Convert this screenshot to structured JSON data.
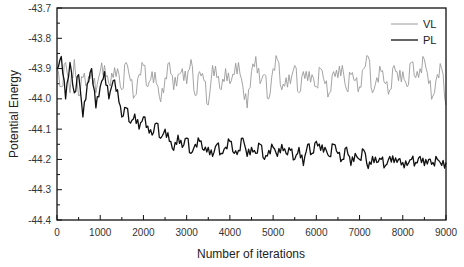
{
  "chart_data": {
    "type": "line",
    "title": "",
    "xlabel": "Number of iterations",
    "ylabel": "Potential Energy",
    "xlim": [
      0,
      9000
    ],
    "ylim": [
      -44.4,
      -43.7
    ],
    "x_ticks": [
      0,
      1000,
      2000,
      3000,
      4000,
      5000,
      6000,
      7000,
      8000,
      9000
    ],
    "x_tick_labels": [
      "0",
      "1000",
      "2000",
      "3000",
      "4000",
      "5000",
      "6000",
      "7000",
      "8000",
      "9000"
    ],
    "y_ticks": [
      -43.7,
      -43.8,
      -43.9,
      -44.0,
      -44.1,
      -44.2,
      -44.3,
      -44.4
    ],
    "y_tick_labels": [
      "-43.7",
      "-43.8",
      "-43.9",
      "-44.0",
      "-44.1",
      "-44.2",
      "-44.3",
      "-44.4"
    ],
    "grid": false,
    "legend_position": "upper right",
    "x": [
      0,
      100,
      200,
      300,
      400,
      500,
      600,
      700,
      800,
      900,
      1000,
      1100,
      1200,
      1300,
      1400,
      1500,
      1600,
      1700,
      1800,
      1900,
      2000,
      2100,
      2200,
      2300,
      2400,
      2500,
      2600,
      2700,
      2800,
      2900,
      3000,
      3100,
      3200,
      3300,
      3400,
      3500,
      3600,
      3700,
      3800,
      3900,
      4000,
      4100,
      4200,
      4300,
      4400,
      4500,
      4600,
      4700,
      4800,
      4900,
      5000,
      5100,
      5200,
      5300,
      5400,
      5500,
      5600,
      5700,
      5800,
      5900,
      6000,
      6100,
      6200,
      6300,
      6400,
      6500,
      6600,
      6700,
      6800,
      6900,
      7000,
      7100,
      7200,
      7300,
      7400,
      7500,
      7600,
      7700,
      7800,
      7900,
      8000,
      8100,
      8200,
      8300,
      8400,
      8500,
      8600,
      8700,
      8800,
      8900,
      9000
    ],
    "series": [
      {
        "name": "VL",
        "color": "#9a9a9a",
        "values": [
          -43.9,
          -43.96,
          -43.88,
          -43.98,
          -43.87,
          -43.99,
          -43.93,
          -43.95,
          -43.9,
          -43.98,
          -43.91,
          -43.89,
          -43.95,
          -43.93,
          -43.9,
          -43.97,
          -43.88,
          -43.94,
          -43.99,
          -43.92,
          -43.89,
          -43.96,
          -43.91,
          -43.95,
          -44.01,
          -43.93,
          -43.88,
          -43.97,
          -43.92,
          -43.9,
          -43.95,
          -43.87,
          -43.99,
          -43.91,
          -43.94,
          -44.02,
          -43.89,
          -43.93,
          -43.97,
          -43.9,
          -43.95,
          -43.92,
          -43.88,
          -43.96,
          -44.03,
          -43.91,
          -43.86,
          -43.95,
          -43.92,
          -44.0,
          -43.9,
          -43.87,
          -43.97,
          -43.93,
          -43.95,
          -43.89,
          -43.98,
          -43.91,
          -43.94,
          -43.92,
          -43.96,
          -43.9,
          -43.95,
          -43.98,
          -43.91,
          -43.93,
          -43.89,
          -43.97,
          -43.92,
          -43.94,
          -43.96,
          -43.9,
          -43.86,
          -43.98,
          -43.93,
          -43.91,
          -43.95,
          -43.97,
          -43.89,
          -43.94,
          -43.91,
          -43.96,
          -43.88,
          -43.93,
          -43.9,
          -43.87,
          -43.95,
          -43.99,
          -43.92,
          -43.9,
          -44.02
        ]
      },
      {
        "name": "PL",
        "color": "#111111",
        "values": [
          -43.9,
          -43.86,
          -44.0,
          -43.88,
          -43.98,
          -43.92,
          -44.06,
          -43.95,
          -43.9,
          -44.03,
          -43.96,
          -43.91,
          -44.0,
          -43.94,
          -43.97,
          -44.06,
          -44.03,
          -44.08,
          -44.05,
          -44.1,
          -44.06,
          -44.09,
          -44.12,
          -44.08,
          -44.13,
          -44.1,
          -44.14,
          -44.17,
          -44.12,
          -44.16,
          -44.13,
          -44.18,
          -44.15,
          -44.14,
          -44.17,
          -44.16,
          -44.19,
          -44.15,
          -44.18,
          -44.16,
          -44.14,
          -44.18,
          -44.17,
          -44.13,
          -44.19,
          -44.16,
          -44.18,
          -44.15,
          -44.2,
          -44.17,
          -44.16,
          -44.19,
          -44.15,
          -44.18,
          -44.17,
          -44.2,
          -44.16,
          -44.22,
          -44.15,
          -44.18,
          -44.14,
          -44.17,
          -44.16,
          -44.19,
          -44.15,
          -44.18,
          -44.2,
          -44.16,
          -44.22,
          -44.18,
          -44.2,
          -44.17,
          -44.23,
          -44.19,
          -44.21,
          -44.2,
          -44.22,
          -44.19,
          -44.21,
          -44.2,
          -44.21,
          -44.22,
          -44.2,
          -44.21,
          -44.19,
          -44.22,
          -44.2,
          -44.21,
          -44.2,
          -44.22,
          -44.21
        ]
      }
    ]
  },
  "legend": {
    "items": [
      {
        "label": "VL",
        "color": "#9a9a9a"
      },
      {
        "label": "PL",
        "color": "#111111"
      }
    ]
  }
}
